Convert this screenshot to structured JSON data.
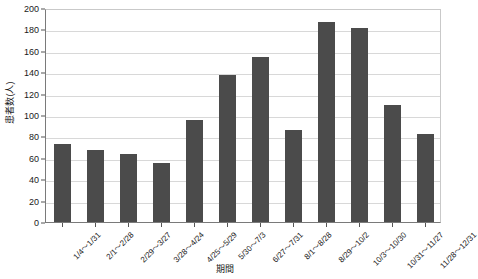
{
  "chart_data": {
    "type": "bar",
    "title": "",
    "subtitle": "",
    "xlabel": "期間",
    "ylabel": "患者数(人)",
    "ylim": [
      0,
      200
    ],
    "ytick_step": 20,
    "yticks": [
      0,
      20,
      40,
      60,
      80,
      100,
      120,
      140,
      160,
      180,
      200
    ],
    "grid": true,
    "legend": "none",
    "bar_color": "#4b4b4b",
    "categories": [
      "1/4～1/31",
      "2/1～2/28",
      "2/29～3/27",
      "3/28～4/24",
      "4/25～5/29",
      "5/30～7/3",
      "6/27～7/31",
      "8/1～8/28",
      "8/29～10/2",
      "10/3～10/30",
      "10/31～11/27",
      "11/28～12/31"
    ],
    "values": [
      73,
      67,
      64,
      55,
      95,
      137,
      154,
      86,
      187,
      181,
      109,
      82
    ],
    "series": [
      {
        "name": "患者数",
        "values": [
          73,
          67,
          64,
          55,
          95,
          137,
          154,
          86,
          187,
          181,
          109,
          82
        ]
      }
    ]
  }
}
